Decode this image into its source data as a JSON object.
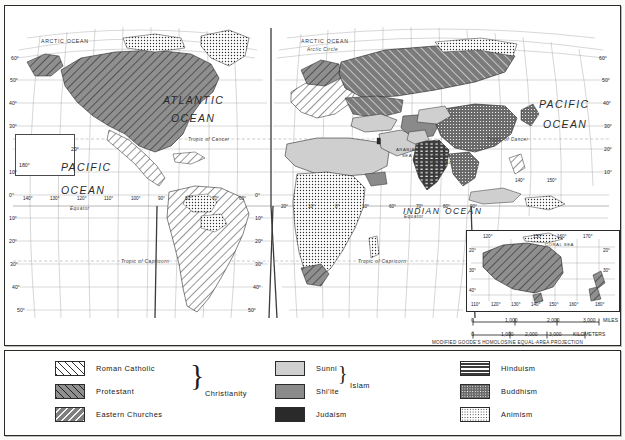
{
  "map": {
    "projection_note": "MODIFIED GOODE'S HOMOLOSINE EQUAL-AREA PROJECTION",
    "ocean_labels": [
      {
        "text": "ATLANTIC",
        "x": 163,
        "y": 94
      },
      {
        "text": "OCEAN",
        "x": 170,
        "y": 112
      },
      {
        "text": "PACIFIC",
        "x": 60,
        "y": 160
      },
      {
        "text": "OCEAN",
        "x": 60,
        "y": 183
      },
      {
        "text": "PACIFIC",
        "x": 540,
        "y": 98
      },
      {
        "text": "OCEAN",
        "x": 545,
        "y": 118
      },
      {
        "text": "INDIAN",
        "x": 404,
        "y": 208
      },
      {
        "text": "OCEAN",
        "x": 443,
        "y": 208
      }
    ],
    "small_labels": [
      {
        "text": "ARCTIC OCEAN",
        "x": 41,
        "y": 36
      },
      {
        "text": "ARCTIC OCEAN",
        "x": 300,
        "y": 36
      },
      {
        "text": "Arctic Circle",
        "x": 306,
        "y": 46
      },
      {
        "text": "ARABIAN",
        "x": 396,
        "y": 146
      },
      {
        "text": "SEA",
        "x": 402,
        "y": 152
      },
      {
        "text": "BAY OF",
        "x": 432,
        "y": 153
      },
      {
        "text": "BENGAL",
        "x": 431,
        "y": 159
      },
      {
        "text": "CORAL SEA",
        "x": 545,
        "y": 240
      }
    ],
    "tropic_labels": [
      {
        "text": "Tropic of Cancer",
        "x": 188,
        "y": 137
      },
      {
        "text": "Tropic of Cancer",
        "x": 487,
        "y": 137
      },
      {
        "text": "Tropic of Capricorn",
        "x": 121,
        "y": 259
      },
      {
        "text": "Tropic of Capricorn",
        "x": 358,
        "y": 259
      },
      {
        "text": "Equator",
        "x": 70,
        "y": 205
      },
      {
        "text": "Equator",
        "x": 404,
        "y": 213
      }
    ],
    "lat_left": [
      "60°",
      "50°",
      "40°",
      "30°",
      "20°",
      "10°",
      "0°",
      "10°",
      "20°",
      "30°",
      "40°",
      "50°"
    ],
    "lat_right": [
      "60°",
      "50°",
      "40°",
      "30°",
      "20°",
      "10°",
      "0°",
      "10°",
      "20°",
      "30°",
      "40°",
      "50°"
    ],
    "lon_labels": [
      "180°",
      "140°",
      "130°",
      "120°",
      "110°",
      "100°",
      "90°",
      "80°",
      "70°",
      "60°",
      "50°",
      "40°",
      "30°",
      "20°",
      "10°",
      "0°",
      "10°",
      "20°",
      "30°",
      "40°",
      "50°",
      "60°",
      "70°",
      "80°",
      "90°",
      "100°",
      "110°",
      "120°",
      "130°",
      "140°",
      "150°",
      "160°",
      "170°"
    ],
    "inset": {
      "lon_top": [
        "120°",
        "150°",
        "160°",
        "170°"
      ],
      "lon_bottom": [
        "110°",
        "120°",
        "130°",
        "140°",
        "150°",
        "160°",
        "180°"
      ],
      "lat_left": [
        "20°",
        "30°",
        "40°"
      ],
      "lat_right": [
        "20°",
        "30°"
      ],
      "scale_miles": {
        "ticks": [
          "0",
          "1,000",
          "2,000",
          "3,000"
        ],
        "unit": "MILES"
      },
      "scale_km": {
        "ticks": [
          "0",
          "1,000",
          "2,000",
          "3,000"
        ],
        "unit": "KILOMETERS"
      }
    },
    "box180_label": "180°"
  },
  "legend": {
    "groups": [
      {
        "name": "Christianity",
        "group_label": "Christianity",
        "items": [
          {
            "label": "Roman Catholic",
            "pattern": "pat-catholic",
            "color": "#ffffff"
          },
          {
            "label": "Protestant",
            "pattern": "pat-protestant",
            "color": "#8f8f8f"
          },
          {
            "label": "Eastern Churches",
            "pattern": "pat-eastern",
            "color": "#7e7e7e"
          }
        ]
      },
      {
        "name": "Islam",
        "group_label": "Islam",
        "items": [
          {
            "label": "Sunni",
            "pattern": "pat-sunni",
            "color": "#cfcfcf"
          },
          {
            "label": "Shi'ite",
            "pattern": "pat-shiite",
            "color": "#8a8a8a"
          },
          {
            "label": "Judaism",
            "pattern": "pat-judaism",
            "color": "#2a2a2a"
          }
        ]
      },
      {
        "name": "Eastern",
        "group_label": "",
        "items": [
          {
            "label": "Hinduism",
            "pattern": "pat-hinduism",
            "color": "#3b3b3b"
          },
          {
            "label": "Buddhism",
            "pattern": "pat-buddhism",
            "color": "#6a6a6a"
          },
          {
            "label": "Animism",
            "pattern": "pat-animism",
            "color": "#ffffff"
          }
        ]
      }
    ]
  }
}
